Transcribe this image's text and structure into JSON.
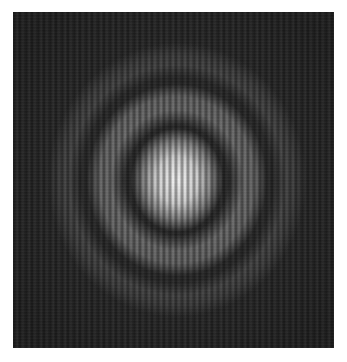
{
  "image": {
    "description": "Grayscale interference/diffraction pattern: bright central spot with concentric rings, overlaid by vertical fringes",
    "colors": {
      "page_background": "#ffffff",
      "image_background": "#2a2a2a",
      "center_peak": "#f0f0f0",
      "fringe_dark": "#909090"
    },
    "frame": {
      "left": 13,
      "top": 12,
      "width": 321,
      "height": 336
    },
    "pattern": {
      "center_px": [
        177,
        180
      ],
      "central_spot_radius_px": [
        36,
        45
      ],
      "rings": [
        {
          "type": "dark",
          "radius_px": 42
        },
        {
          "type": "bright",
          "radius_px": 68
        },
        {
          "type": "dark",
          "radius_px": 90
        },
        {
          "type": "bright",
          "radius_px": 112
        },
        {
          "type": "dark",
          "radius_px": 135
        }
      ],
      "fringe_orientation": "vertical",
      "fringe_period_px": 6
    }
  }
}
